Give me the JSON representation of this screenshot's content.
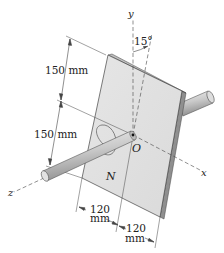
{
  "diagram": {
    "type": "engineering-statics-figure",
    "axes": {
      "x_label": "x",
      "y_label": "y",
      "z_label": "z",
      "origin_label": "O"
    },
    "angle_label": "15°",
    "moment_label": "N",
    "dimensions": {
      "upper_vertical": "150 mm",
      "lower_vertical": "150 mm",
      "left_horizontal_value": "120",
      "left_horizontal_unit": "mm",
      "right_horizontal_value": "120",
      "right_horizontal_unit": "mm"
    },
    "colors": {
      "plate_face": "#e2e2e2",
      "plate_edge": "#9a9a9a",
      "rod": "#c8c8c8",
      "line": "#333333"
    }
  }
}
